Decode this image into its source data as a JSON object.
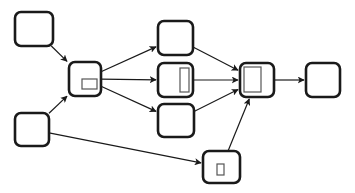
{
  "diagram": {
    "type": "directed-graph",
    "stroke_color": "#1a1a1a",
    "inner_stroke_color": "#555555",
    "background": "#ffffff",
    "nodes": [
      {
        "id": "n1",
        "label": "",
        "inner": "none"
      },
      {
        "id": "n2",
        "label": "",
        "inner": "wide-rect"
      },
      {
        "id": "n3",
        "label": "",
        "inner": "none"
      },
      {
        "id": "n4",
        "label": "",
        "inner": "none"
      },
      {
        "id": "n5",
        "label": "",
        "inner": "tall-rect"
      },
      {
        "id": "n6",
        "label": "",
        "inner": "none"
      },
      {
        "id": "n7",
        "label": "",
        "inner": "large-rect"
      },
      {
        "id": "n8",
        "label": "",
        "inner": "none"
      },
      {
        "id": "n9",
        "label": "",
        "inner": "small-rect"
      }
    ],
    "edges": [
      {
        "from": "n1",
        "to": "n2"
      },
      {
        "from": "n3",
        "to": "n2"
      },
      {
        "from": "n2",
        "to": "n4"
      },
      {
        "from": "n2",
        "to": "n5"
      },
      {
        "from": "n2",
        "to": "n6"
      },
      {
        "from": "n3",
        "to": "n9"
      },
      {
        "from": "n4",
        "to": "n7"
      },
      {
        "from": "n5",
        "to": "n7"
      },
      {
        "from": "n6",
        "to": "n7"
      },
      {
        "from": "n9",
        "to": "n7"
      },
      {
        "from": "n7",
        "to": "n8"
      }
    ]
  }
}
